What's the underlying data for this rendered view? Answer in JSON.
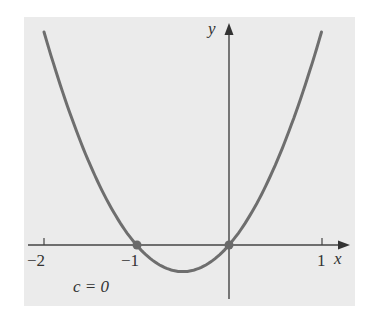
{
  "chart_data": {
    "type": "line",
    "title": "",
    "function": "y = x^2 + x",
    "annotation": "c = 0",
    "xlabel": "x",
    "ylabel": "y",
    "xlim": [
      -2.2,
      1.3
    ],
    "x_ticks": [
      -2,
      -1,
      1
    ],
    "x_tick_labels": [
      "−2",
      "−1",
      "1"
    ],
    "series": [
      {
        "name": "c = 0",
        "x": [
          -2,
          -1.5,
          -1,
          -0.5,
          0,
          0.5,
          1
        ],
        "y": [
          2,
          0.75,
          0,
          -0.25,
          0,
          0.75,
          2
        ]
      }
    ],
    "marked_points": [
      {
        "x": -1,
        "y": 0
      },
      {
        "x": 0,
        "y": 0
      }
    ],
    "grid": false
  },
  "labels": {
    "x_axis": "x",
    "y_axis": "y",
    "tick_neg2": "−2",
    "tick_neg1": "−1",
    "tick_1": "1",
    "annotation": "c = 0"
  },
  "colors": {
    "panel": "#ebebeb",
    "curve": "#6e6e6e",
    "axis": "#444444",
    "point": "#6a6a6a"
  }
}
